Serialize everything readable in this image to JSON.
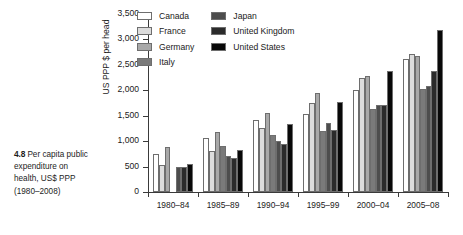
{
  "caption": {
    "number": "4.8",
    "text": "Per capita public expenditure on health, US$ PPP (1980–2008)"
  },
  "legend": {
    "position": "top-left-inside",
    "columns": [
      [
        "Canada",
        "France",
        "Germany",
        "Italy"
      ],
      [
        "Japan",
        "United Kingdom",
        "United States"
      ]
    ]
  },
  "colors": {
    "Canada": "#ffffff",
    "France": "#dcdcdc",
    "Germany": "#a8a8a8",
    "Italy": "#7a7a7a",
    "Japan": "#4d4d4d",
    "United Kingdom": "#2b2b2b",
    "United States": "#080808",
    "axis": "#3a3a3a",
    "bar_outline": "#6e6e6e",
    "text": "#1a1a1a"
  },
  "chart_data": {
    "type": "bar",
    "title": "",
    "subtitle": "",
    "xlabel": "",
    "ylabel": "US PPP $ per head",
    "ylim": [
      0,
      3500
    ],
    "yticks": [
      0,
      500,
      1000,
      1500,
      2000,
      2500,
      3000,
      3500
    ],
    "ytick_labels": [
      "0",
      "500",
      "1,000",
      "1,500",
      "2,000",
      "2,500",
      "3,000",
      "3,500"
    ],
    "grid": false,
    "categories": [
      "1980–84",
      "1985–89",
      "1990–94",
      "1995–99",
      "2000–04",
      "2005–08"
    ],
    "series": [
      {
        "name": "Canada",
        "values": [
          750,
          1055,
          1410,
          1530,
          2000,
          2610
        ]
      },
      {
        "name": "France",
        "values": [
          530,
          800,
          1250,
          1760,
          2245,
          2710
        ]
      },
      {
        "name": "Germany",
        "values": [
          890,
          1180,
          1550,
          1950,
          2285,
          2680
        ]
      },
      {
        "name": "Italy",
        "values": [
          null,
          910,
          1130,
          1200,
          1640,
          2030
        ]
      },
      {
        "name": "Japan",
        "values": [
          500,
          700,
          1000,
          1360,
          1720,
          2090
        ]
      },
      {
        "name": "United Kingdom",
        "values": [
          490,
          670,
          950,
          1210,
          1720,
          2370
        ]
      },
      {
        "name": "United States",
        "values": [
          550,
          830,
          1340,
          1770,
          2370,
          3180
        ]
      }
    ]
  }
}
